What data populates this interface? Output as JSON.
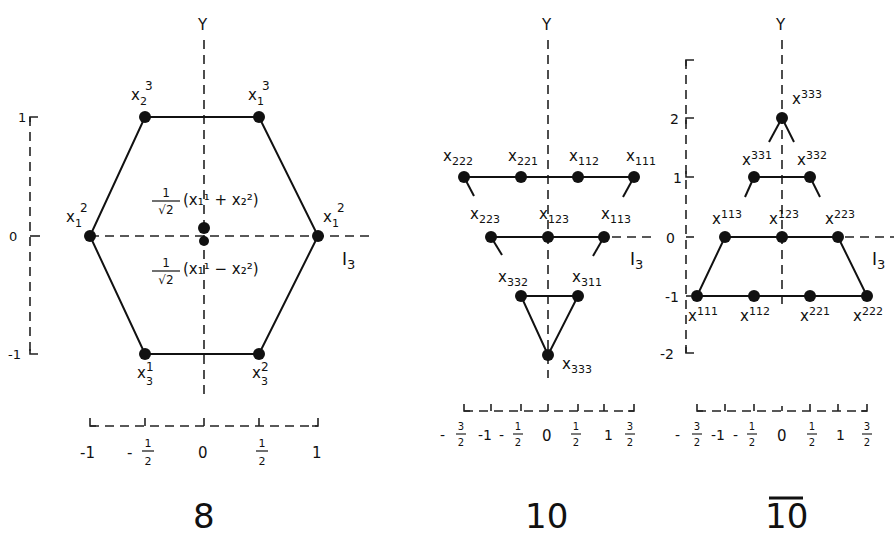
{
  "figure": {
    "panels": [
      {
        "id": "octet",
        "title": "8",
        "y_axis_label": "Y",
        "x_axis_label": "I",
        "x_axis_label_sub": "3",
        "y_ticks": [
          "1",
          "0",
          "-1"
        ],
        "x_ticks": [
          {
            "type": "int",
            "text": "-1"
          },
          {
            "type": "frac",
            "sign": "-",
            "num": "1",
            "den": "2"
          },
          {
            "type": "int",
            "text": "0"
          },
          {
            "type": "frac",
            "sign": "",
            "num": "1",
            "den": "2"
          },
          {
            "type": "int",
            "text": "1"
          }
        ],
        "states": [
          {
            "base": "x",
            "sub": "2",
            "sup": "3",
            "I3": -0.5,
            "Y": 1
          },
          {
            "base": "x",
            "sub": "1",
            "sup": "3",
            "I3": 0.5,
            "Y": 1
          },
          {
            "base": "x",
            "sub": "1",
            "sup": "2",
            "I3": -1,
            "Y": 0
          },
          {
            "base": "x",
            "sub": "1",
            "sup": "2",
            "I3": 1,
            "Y": 0
          },
          {
            "base": "x",
            "sub": "3",
            "sup": "1",
            "I3": -0.5,
            "Y": -1
          },
          {
            "base": "x",
            "sub": "3",
            "sup": "2",
            "I3": 0.5,
            "Y": -1
          }
        ],
        "center_states": {
          "upper": {
            "coef_num": "1",
            "coef_den": "√2",
            "expr": "(x₁¹ + x₂²)"
          },
          "lower": {
            "coef_num": "1",
            "coef_den": "√2",
            "expr": "(x₁¹ − x₂²)"
          }
        }
      },
      {
        "id": "decuplet",
        "title": "10",
        "y_axis_label": "Y",
        "x_axis_label": "I",
        "x_axis_label_sub": "3",
        "x_ticks": [
          {
            "type": "frac",
            "sign": "-",
            "num": "3",
            "den": "2"
          },
          {
            "type": "int",
            "text": "-1"
          },
          {
            "type": "frac",
            "sign": "-",
            "num": "1",
            "den": "2"
          },
          {
            "type": "int",
            "text": "0"
          },
          {
            "type": "frac",
            "sign": "",
            "num": "1",
            "den": "2"
          },
          {
            "type": "int",
            "text": "1"
          },
          {
            "type": "frac",
            "sign": "",
            "num": "3",
            "den": "2"
          }
        ],
        "states": [
          {
            "base": "x",
            "sub": "222",
            "I3": -1.5,
            "Y": 1
          },
          {
            "base": "x",
            "sub": "221",
            "I3": -0.5,
            "Y": 1
          },
          {
            "base": "x",
            "sub": "112",
            "I3": 0.5,
            "Y": 1
          },
          {
            "base": "x",
            "sub": "111",
            "I3": 1.5,
            "Y": 1
          },
          {
            "base": "x",
            "sub": "223",
            "I3": -1,
            "Y": 0
          },
          {
            "base": "x",
            "sub": "123",
            "I3": 0,
            "Y": 0
          },
          {
            "base": "x",
            "sub": "113",
            "I3": 1,
            "Y": 0
          },
          {
            "base": "x",
            "sub": "332",
            "I3": -0.5,
            "Y": -1
          },
          {
            "base": "x",
            "sub": "311",
            "I3": 0.5,
            "Y": -1
          },
          {
            "base": "x",
            "sub": "333",
            "I3": 0,
            "Y": -2
          }
        ]
      },
      {
        "id": "antidecuplet",
        "title": "10",
        "title_overline": true,
        "y_axis_label": "Y",
        "x_axis_label": "I",
        "x_axis_label_sub": "3",
        "y_ticks": [
          "2",
          "1",
          "0",
          "-1",
          "-2"
        ],
        "x_ticks": [
          {
            "type": "frac",
            "sign": "-",
            "num": "3",
            "den": "2"
          },
          {
            "type": "int",
            "text": "-1"
          },
          {
            "type": "frac",
            "sign": "-",
            "num": "1",
            "den": "2"
          },
          {
            "type": "int",
            "text": "0"
          },
          {
            "type": "frac",
            "sign": "",
            "num": "1",
            "den": "2"
          },
          {
            "type": "int",
            "text": "1"
          },
          {
            "type": "frac",
            "sign": "",
            "num": "3",
            "den": "2"
          }
        ],
        "states": [
          {
            "base": "x",
            "sup": "333",
            "I3": 0,
            "Y": 2
          },
          {
            "base": "x",
            "sup": "331",
            "I3": -0.5,
            "Y": 1
          },
          {
            "base": "x",
            "sup": "332",
            "I3": 0.5,
            "Y": 1
          },
          {
            "base": "x",
            "sup": "113",
            "I3": -1,
            "Y": 0
          },
          {
            "base": "x",
            "sup": "123",
            "I3": 0,
            "Y": 0
          },
          {
            "base": "x",
            "sup": "223",
            "I3": 1,
            "Y": 0
          },
          {
            "base": "x",
            "sup": "111",
            "I3": -1.5,
            "Y": -1
          },
          {
            "base": "x",
            "sup": "112",
            "I3": -0.5,
            "Y": -1
          },
          {
            "base": "x",
            "sup": "221",
            "I3": 0.5,
            "Y": -1
          },
          {
            "base": "x",
            "sup": "222",
            "I3": 1.5,
            "Y": -1
          }
        ]
      }
    ]
  }
}
